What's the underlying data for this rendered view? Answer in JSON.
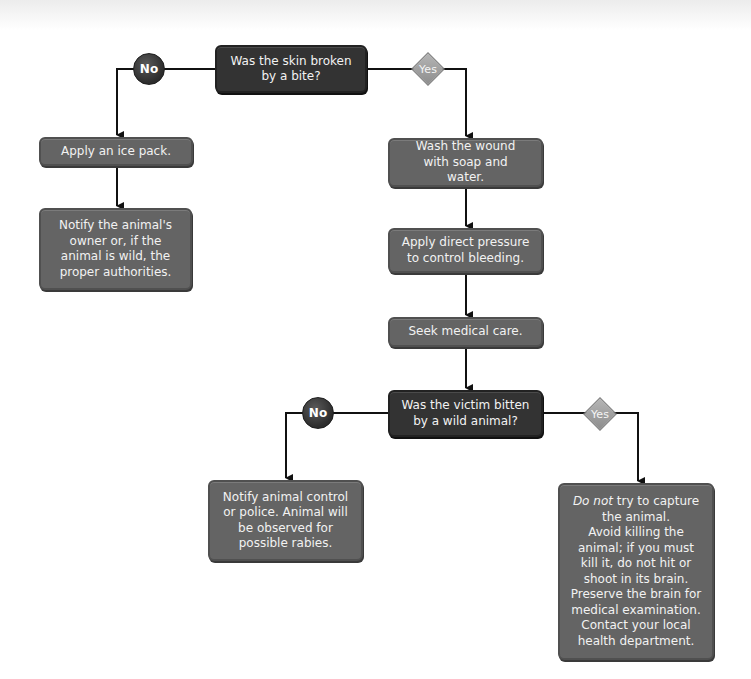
{
  "flowchart": {
    "decision1": {
      "text": "Was the skin broken by a bite?",
      "no_label": "No",
      "yes_label": "Yes"
    },
    "no_branch1": {
      "step1": "Apply an ice pack.",
      "step2": "Notify the animal's owner or, if the animal is wild, the proper authorities."
    },
    "yes_branch1": {
      "step1": "Wash the wound with soap and water.",
      "step2": "Apply direct pressure to control bleeding.",
      "step3": "Seek medical care."
    },
    "decision2": {
      "text": "Was the victim bitten by a wild animal?",
      "no_label": "No",
      "yes_label": "Yes"
    },
    "no_branch2": {
      "step1": "Notify animal control or police. Animal will be observed for possible rabies."
    },
    "yes_branch2": {
      "step1_emphasis": "Do not",
      "step1_rest": " try to capture the animal.",
      "step2": "Avoid killing the animal; if you must kill it, do not hit or shoot in its brain.",
      "step3": "Preserve the brain for medical examination.",
      "step4": "Contact your local health department."
    }
  },
  "colors": {
    "decision_fill": "#333333",
    "action_fill": "#646464",
    "yes_diamond": "#a0a0a0",
    "no_circle": "#3a3a3a",
    "connector": "#111111"
  }
}
